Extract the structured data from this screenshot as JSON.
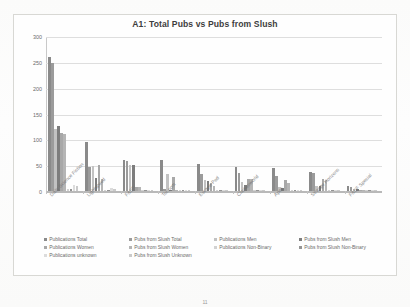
{
  "page": {
    "page_number": "11"
  },
  "chart_data": {
    "type": "bar",
    "title": "A1: Total Pubs vs Pubs from Slush",
    "xlabel": "",
    "ylabel": "",
    "ylim": [
      0,
      300
    ],
    "yticks": [
      0,
      50,
      100,
      150,
      200,
      250,
      300
    ],
    "ytick_labels": [
      "0",
      "50",
      "100",
      "150",
      "200",
      "250",
      "300"
    ],
    "grid": true,
    "legend_position": "bottom",
    "categories": [
      "Daily Science Fiction",
      "Lightspeed",
      "F&SF",
      "Tor.com",
      "Escape Pod",
      "Clarkesworld",
      "Apex",
      "Strange Horizons",
      "F&SF Special"
    ],
    "series": [
      {
        "name": "Publications Total",
        "color": "#8a8a8a",
        "values": [
          260,
          95,
          60,
          60,
          53,
          47,
          45,
          37,
          9
        ]
      },
      {
        "name": "Pubs from Slush Total",
        "color": "#9b9b9b",
        "values": [
          247,
          47,
          58,
          4,
          32,
          34,
          29,
          34,
          8
        ]
      },
      {
        "name": "Publications Men",
        "color": "#c2c2c2",
        "values": [
          120,
          48,
          50,
          32,
          22,
          18,
          7,
          9,
          3
        ]
      },
      {
        "name": "Pubs from Slush Men",
        "color": "#7d7d7d",
        "values": [
          125,
          25,
          50,
          2,
          20,
          11,
          6,
          10,
          3
        ]
      },
      {
        "name": "Publications Women",
        "color": "#a8a8a8",
        "values": [
          113,
          50,
          8,
          28,
          15,
          23,
          21,
          23,
          2
        ]
      },
      {
        "name": "Pubs from Slush Women",
        "color": "#b5b5b5",
        "values": [
          110,
          23,
          7,
          1,
          9,
          23,
          16,
          22,
          2
        ]
      },
      {
        "name": "Publications Non-Binary",
        "color": "#d2d2d2",
        "values": [
          3,
          2,
          1,
          1,
          1,
          1,
          1,
          1,
          0
        ]
      },
      {
        "name": "Pubs from Slush Non-Binary",
        "color": "#949494",
        "values": [
          3,
          2,
          1,
          1,
          1,
          1,
          1,
          1,
          0
        ]
      },
      {
        "name": "Publications unknown",
        "color": "#dcdcdc",
        "values": [
          11,
          5,
          2,
          1,
          2,
          2,
          2,
          2,
          1
        ]
      },
      {
        "name": "Pubs from Slush Unknown",
        "color": "#cacaca",
        "values": [
          10,
          4,
          2,
          1,
          2,
          2,
          2,
          2,
          1
        ]
      }
    ]
  }
}
